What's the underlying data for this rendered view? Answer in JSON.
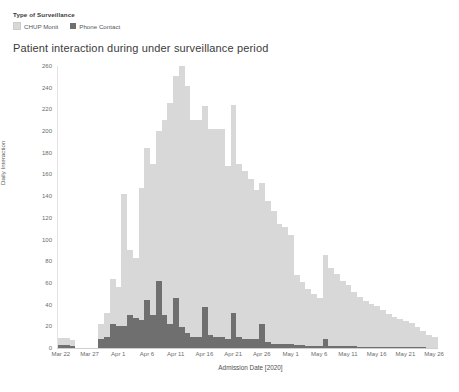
{
  "legend": {
    "title": "Type of Surveillance",
    "items": [
      {
        "label": "CHUP Monit",
        "color": "#d8d8d8",
        "name": "chup-monit"
      },
      {
        "label": "Phone Contact",
        "color": "#6f6f6f",
        "name": "phone-contact"
      }
    ]
  },
  "title": "Patient interaction during under surveillance period",
  "chart_data": {
    "type": "bar",
    "title": "Patient interaction during under surveillance period",
    "subtitle": "",
    "xlabel": "Admission Date [2020]",
    "ylabel": "Daily Interaction",
    "stacked": true,
    "grid": false,
    "legend_position": "top-left",
    "legend_title": "Type of Surveillance",
    "ylim": [
      0,
      260
    ],
    "yticks": [
      0,
      20,
      40,
      60,
      80,
      100,
      120,
      140,
      160,
      180,
      200,
      220,
      240,
      260
    ],
    "ytick_labels": [
      "0",
      "20",
      "40",
      "60",
      "80",
      "100",
      "120",
      "140",
      "160",
      "180",
      "200",
      "220",
      "240",
      "260"
    ],
    "xtick_labels": [
      "Mar 22",
      "Mar 27",
      "Apr 1",
      "Apr 6",
      "Apr 11",
      "Apr 16",
      "Apr 21",
      "Apr 26",
      "May 1",
      "May 6",
      "May 11",
      "May 16",
      "May 21",
      "May 26"
    ],
    "x": [
      "Mar 22",
      "Mar 23",
      "Mar 24",
      "Mar 25",
      "Mar 26",
      "Mar 27",
      "Mar 28",
      "Mar 29",
      "Mar 30",
      "Mar 31",
      "Apr 1",
      "Apr 2",
      "Apr 3",
      "Apr 4",
      "Apr 5",
      "Apr 6",
      "Apr 7",
      "Apr 8",
      "Apr 9",
      "Apr 10",
      "Apr 11",
      "Apr 12",
      "Apr 13",
      "Apr 14",
      "Apr 15",
      "Apr 16",
      "Apr 17",
      "Apr 18",
      "Apr 19",
      "Apr 20",
      "Apr 21",
      "Apr 22",
      "Apr 23",
      "Apr 24",
      "Apr 25",
      "Apr 26",
      "Apr 27",
      "Apr 28",
      "Apr 29",
      "Apr 30",
      "May 1",
      "May 2",
      "May 3",
      "May 4",
      "May 5",
      "May 6",
      "May 7",
      "May 8",
      "May 9",
      "May 10",
      "May 11",
      "May 12",
      "May 13",
      "May 14",
      "May 15",
      "May 16",
      "May 17",
      "May 18",
      "May 19",
      "May 20",
      "May 21",
      "May 22",
      "May 23",
      "May 24",
      "May 25",
      "May 26"
    ],
    "series": [
      {
        "name": "CHUP Monit",
        "color": "#d8d8d8",
        "values": [
          6,
          6,
          5,
          0,
          0,
          0,
          0,
          14,
          22,
          42,
          36,
          122,
          60,
          55,
          122,
          140,
          140,
          138,
          180,
          204,
          205,
          250,
          228,
          200,
          200,
          185,
          190,
          192,
          192,
          160,
          192,
          160,
          155,
          148,
          138,
          130,
          130,
          122,
          110,
          108,
          100,
          64,
          58,
          52,
          48,
          44,
          78,
          72,
          66,
          60,
          56,
          50,
          46,
          42,
          40,
          38,
          34,
          30,
          28,
          26,
          24,
          22,
          18,
          15,
          12,
          10
        ]
      },
      {
        "name": "Phone Contact",
        "color": "#6f6f6f",
        "values": [
          3,
          3,
          2,
          0,
          0,
          0,
          0,
          8,
          10,
          22,
          20,
          20,
          30,
          28,
          26,
          44,
          30,
          62,
          30,
          22,
          46,
          20,
          14,
          10,
          10,
          38,
          12,
          10,
          10,
          8,
          32,
          10,
          8,
          8,
          8,
          22,
          6,
          4,
          4,
          4,
          4,
          3,
          3,
          2,
          2,
          2,
          8,
          2,
          2,
          2,
          2,
          2,
          1,
          1,
          1,
          1,
          1,
          1,
          1,
          1,
          1,
          1,
          1,
          1,
          0,
          0
        ]
      }
    ]
  },
  "axes": {
    "y_title": "Daily Interaction",
    "x_title": "Admission Date [2020]"
  }
}
